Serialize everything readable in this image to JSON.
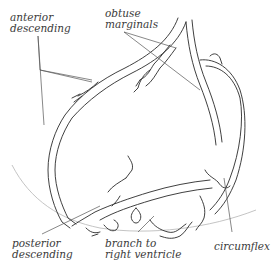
{
  "diagram": {
    "labels": [
      {
        "id": "anterior-descending",
        "lines": [
          "anterior",
          "descending"
        ]
      },
      {
        "id": "obtuse-marginals",
        "lines": [
          "obtuse",
          "marginals"
        ]
      },
      {
        "id": "posterior-descending",
        "lines": [
          "posterior",
          "descending"
        ]
      },
      {
        "id": "branch-to-right-ventricle",
        "lines": [
          "branch to",
          "right ventricle"
        ]
      },
      {
        "id": "circumflex",
        "lines": [
          "circumflex"
        ]
      }
    ],
    "colors": {
      "vessel_stroke": "#2a2a2a",
      "leader_line": "#555555",
      "heart_outline": "#bdbdbd",
      "label_text": "#3a3a3a",
      "background": "#ffffff"
    }
  }
}
